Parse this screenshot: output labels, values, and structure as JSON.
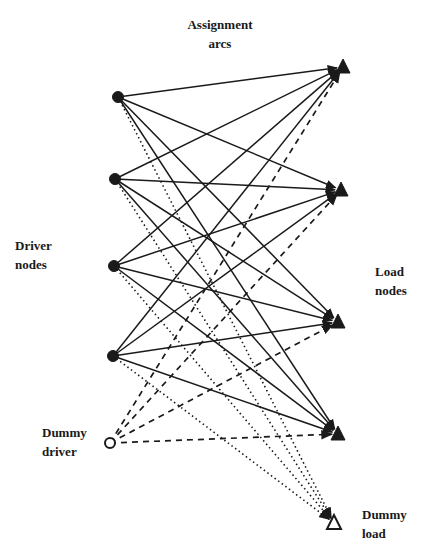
{
  "figure": {
    "type": "bipartite assignment network",
    "labels": {
      "assignment_arcs": [
        "Assignment",
        "arcs"
      ],
      "driver_nodes": [
        "Driver",
        "nodes"
      ],
      "load_nodes": [
        "Load",
        "nodes"
      ],
      "dummy_driver": [
        "Dummy",
        "driver"
      ],
      "dummy_load": [
        "Dummy",
        "load"
      ]
    },
    "colors": {
      "ink": "#1a1a1a",
      "background": "#ffffff"
    },
    "nodes": {
      "drivers": [
        {
          "id": "D1",
          "x": 118,
          "y": 97,
          "shape": "filled-circle"
        },
        {
          "id": "D2",
          "x": 115,
          "y": 179,
          "shape": "filled-circle"
        },
        {
          "id": "D3",
          "x": 114,
          "y": 266,
          "shape": "filled-circle"
        },
        {
          "id": "D4",
          "x": 113,
          "y": 356,
          "shape": "filled-circle"
        }
      ],
      "dummy_driver": {
        "id": "DD",
        "x": 110,
        "y": 443,
        "shape": "open-circle"
      },
      "loads": [
        {
          "id": "L1",
          "x": 343,
          "y": 67,
          "shape": "filled-triangle"
        },
        {
          "id": "L2",
          "x": 341,
          "y": 190,
          "shape": "filled-triangle"
        },
        {
          "id": "L3",
          "x": 338,
          "y": 322,
          "shape": "filled-triangle"
        },
        {
          "id": "L4",
          "x": 338,
          "y": 434,
          "shape": "filled-triangle"
        }
      ],
      "dummy_load": {
        "id": "DL",
        "x": 334,
        "y": 523,
        "shape": "open-triangle"
      }
    },
    "edges": {
      "solid": "every driver node to every load node",
      "dotted": "every driver node to dummy load",
      "dashed": "dummy driver to every load node"
    }
  }
}
